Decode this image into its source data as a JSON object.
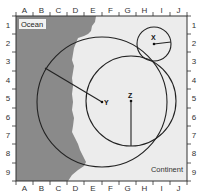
{
  "figure": {
    "type": "map-grid-diagram",
    "labels": {
      "ocean": "Ocean",
      "continent": "Continent"
    },
    "columns": [
      "A",
      "B",
      "C",
      "D",
      "E",
      "F",
      "G",
      "H",
      "I",
      "J"
    ],
    "rows": [
      "1",
      "2",
      "3",
      "4",
      "5",
      "6",
      "7",
      "8",
      "9"
    ],
    "colors": {
      "ocean": "#8a8a8a",
      "continent": "#eeeeee",
      "line": "#222222",
      "frame": "#333333"
    },
    "points": [
      {
        "label": "X",
        "cx": 154,
        "cy": 44,
        "r": 17,
        "radius_to": [
          172,
          41
        ]
      },
      {
        "label": "Y",
        "cx": 102,
        "cy": 102,
        "r": 65,
        "radius_to": [
          45,
          68
        ]
      },
      {
        "label": "Z",
        "cx": 131,
        "cy": 101,
        "r": 45,
        "radius_to": [
          131,
          146
        ]
      }
    ]
  }
}
